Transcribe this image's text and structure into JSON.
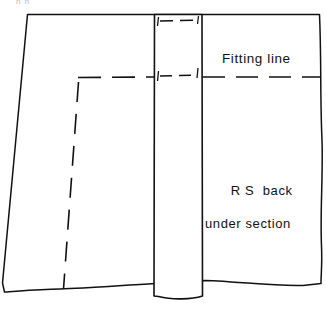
{
  "figure": {
    "type": "sewing-pattern-diagram",
    "title_fragment": "n n",
    "background_color": "#ffffff",
    "ink_color": "#111111",
    "width": 326,
    "height": 313
  },
  "labels": {
    "fitting_line": "Fitting line",
    "rs_back_line1": "R S  back",
    "rs_back_line2": "under section"
  },
  "shapes": {
    "fabric_panel": {
      "name": "fabric-panel",
      "description": "large quadrilateral fabric piece with slanted left edge and wavy bottom/right edges",
      "points": "27,14 320,14 322,282 303,286 205,281 155,284 60,288 4,292 2,283"
    },
    "facing_strip": {
      "name": "facing-strip",
      "description": "narrow vertical strip laid over the fabric, extending past the bottom edge",
      "x": 154,
      "y": 14,
      "width": 48,
      "height": 285
    }
  },
  "lines": {
    "fitting_line_right": {
      "name": "fitting-line-dashed-right",
      "style": "dashed",
      "y": 77,
      "x_start": 203,
      "x_end": 321
    },
    "fitting_line_left": {
      "name": "fitting-line-dashed-left",
      "style": "dashed",
      "y": 77,
      "x_start": 78,
      "x_end": 154
    },
    "strip_fitting_dash": {
      "name": "fitting-line-dashed-on-strip",
      "style": "dashed",
      "y": 76,
      "x_start": 159,
      "x_end": 198
    },
    "strip_top_dash": {
      "name": "seam-line-dashed-on-strip-top",
      "style": "dashed",
      "y": 21,
      "x_start": 159,
      "x_end": 199
    },
    "seam_line_vertical": {
      "name": "seam-line-dashed-vertical",
      "style": "dashed",
      "x_top": 78,
      "y_top": 84,
      "x_bottom": 64,
      "y_bottom": 288
    }
  },
  "notches": {
    "description": "small tick marks at the strip edges marking the fitting and seam lines",
    "marks": [
      {
        "name": "notch-strip-left-top",
        "x": 158,
        "y": 19
      },
      {
        "name": "notch-strip-right-top",
        "x": 198,
        "y": 19
      },
      {
        "name": "notch-strip-left-mid",
        "x": 158,
        "y": 74
      },
      {
        "name": "notch-strip-right-mid",
        "x": 197,
        "y": 73
      }
    ]
  },
  "colors": {
    "ink": "#111111",
    "paper": "#ffffff",
    "faint": "#b9b9b9"
  }
}
